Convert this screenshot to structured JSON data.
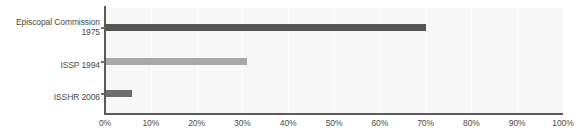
{
  "chart_data": {
    "type": "bar",
    "orientation": "horizontal",
    "title": "",
    "xlabel": "",
    "ylabel": "",
    "categories": [
      "Episcopal Commission\n1975",
      "ISSP 1994",
      "ISSHR 2006"
    ],
    "values": [
      70,
      31,
      6
    ],
    "series": [
      {
        "name": "percent",
        "values": [
          70,
          31,
          6
        ]
      }
    ],
    "bar_colors": [
      "#555555",
      "#a8a8a8",
      "#6e6e6e"
    ],
    "xlim": [
      0,
      100
    ],
    "xticks": [
      0,
      10,
      20,
      30,
      40,
      50,
      60,
      70,
      80,
      90,
      100
    ],
    "xtick_labels": [
      "0%",
      "10%",
      "20%",
      "30%",
      "40%",
      "50%",
      "60%",
      "70%",
      "80%",
      "90%",
      "100%"
    ],
    "grid": true,
    "grid_axis": "x",
    "grid_color": "#fdfdfd",
    "legend": false,
    "plot_background": "#f7f7f7",
    "figure_background": "#ffffff",
    "axis_color": "#5a5a5a",
    "tick_label_color": "#4a4a4a"
  },
  "axis": {
    "x_tick_labels": [
      "0%",
      "10%",
      "20%",
      "30%",
      "40%",
      "50%",
      "60%",
      "70%",
      "80%",
      "90%",
      "100%"
    ],
    "y_category_labels": [
      "Episcopal Commission\n1975",
      "ISSP 1994",
      "ISSHR 2006"
    ]
  }
}
